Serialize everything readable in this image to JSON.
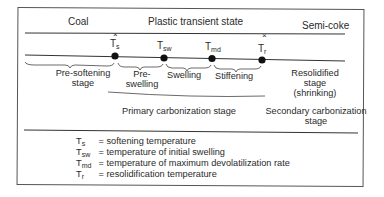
{
  "states": {
    "coal": "Coal",
    "plastic": "Plastic transient state",
    "semicoke": "Semi-coke"
  },
  "markers": [
    {
      "symbol": "T",
      "sub": "s"
    },
    {
      "symbol": "T",
      "sub": "sw"
    },
    {
      "symbol": "T",
      "sub": "md"
    },
    {
      "symbol": "T",
      "sub": "r"
    }
  ],
  "stages": {
    "pre_softening": [
      "Pre-softening",
      "stage"
    ],
    "pre_swelling": [
      "Pre-",
      "swelling"
    ],
    "swelling": "Swelling",
    "stiffening": "Stiffening",
    "resolidified": [
      "Resolidified",
      "stage",
      "(shrinking)"
    ],
    "primary": "Primary carbonization stage",
    "secondary": [
      "Secondary carbonization",
      "stage"
    ]
  },
  "legend": [
    {
      "symbol": "T",
      "sub": "s",
      "text": "= softening temperature"
    },
    {
      "symbol": "T",
      "sub": "sw",
      "text": "= temperature of initial swelling"
    },
    {
      "symbol": "T",
      "sub": "md",
      "text": "= temperature of maximum devolatilization rate"
    },
    {
      "symbol": "T",
      "sub": "r",
      "text": "= resolidification temperature"
    }
  ],
  "colors": {
    "line": "#333333",
    "dot": "#111111",
    "text": "#2a2a2a"
  }
}
